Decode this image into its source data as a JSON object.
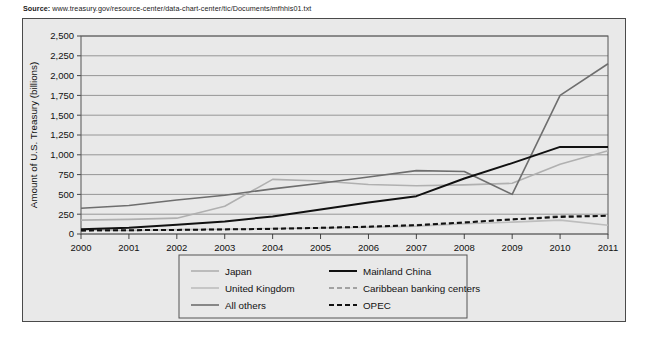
{
  "source": {
    "label": "Source:",
    "url": "www.treasury.gov/resource-center/data-chart-center/tic/Documents/mfhhis01.txt"
  },
  "chart_data": {
    "type": "line",
    "title": "",
    "xlabel": "Year",
    "ylabel": "Amount of U.S. Treasury (billions)",
    "x": [
      2000,
      2001,
      2002,
      2003,
      2004,
      2005,
      2006,
      2007,
      2008,
      2009,
      2010,
      2011
    ],
    "xticklabels": [
      "2000",
      "2001",
      "2002",
      "2003",
      "2004",
      "2005",
      "2006",
      "2007",
      "2008",
      "2009",
      "2010",
      "2011"
    ],
    "yticks": [
      0,
      250,
      500,
      750,
      1000,
      1250,
      1500,
      1750,
      2000,
      2250,
      2500
    ],
    "yticklabels": [
      "0",
      "250",
      "500",
      "750",
      "1,000",
      "1,250",
      "1,500",
      "1,750",
      "2,000",
      "2,250",
      "2,500"
    ],
    "ylim": [
      0,
      2500
    ],
    "xlim": [
      2000,
      2011
    ],
    "grid": "horizontal",
    "legend_position": "below",
    "series": [
      {
        "name": "Japan",
        "color": "#b0b0b0",
        "style": "solid",
        "values": [
          175,
          185,
          200,
          350,
          690,
          670,
          625,
          610,
          620,
          640,
          880,
          1050
        ]
      },
      {
        "name": "United Kingdom",
        "color": "#bdbdbd",
        "style": "solid",
        "values": [
          50,
          45,
          55,
          60,
          70,
          75,
          85,
          100,
          130,
          150,
          175,
          110
        ]
      },
      {
        "name": "All others",
        "color": "#6e6e6e",
        "style": "solid",
        "values": [
          325,
          360,
          430,
          490,
          570,
          640,
          720,
          800,
          790,
          500,
          1750,
          2150
        ]
      },
      {
        "name": "Mainland China",
        "color": "#111111",
        "style": "solid",
        "values": [
          60,
          78,
          118,
          159,
          222,
          310,
          397,
          478,
          700,
          895,
          1100,
          1100
        ]
      },
      {
        "name": "Caribbean banking centers",
        "color": "#8a8a8a",
        "style": "dashed",
        "values": [
          40,
          45,
          50,
          60,
          70,
          80,
          95,
          115,
          150,
          180,
          230,
          230
        ]
      },
      {
        "name": "OPEC",
        "color": "#111111",
        "style": "dashed",
        "values": [
          45,
          48,
          52,
          58,
          65,
          78,
          92,
          110,
          145,
          185,
          215,
          230
        ]
      }
    ]
  },
  "legend": {
    "entries": [
      {
        "label": "Japan"
      },
      {
        "label": "United Kingdom"
      },
      {
        "label": "All others"
      },
      {
        "label": "Mainland China"
      },
      {
        "label": "Caribbean banking centers"
      },
      {
        "label": "OPEC"
      }
    ]
  },
  "colors": {
    "plot_background": "#e9e9e9",
    "frame_border": "#4a4a4a",
    "gridline": "#8c8c8c"
  }
}
